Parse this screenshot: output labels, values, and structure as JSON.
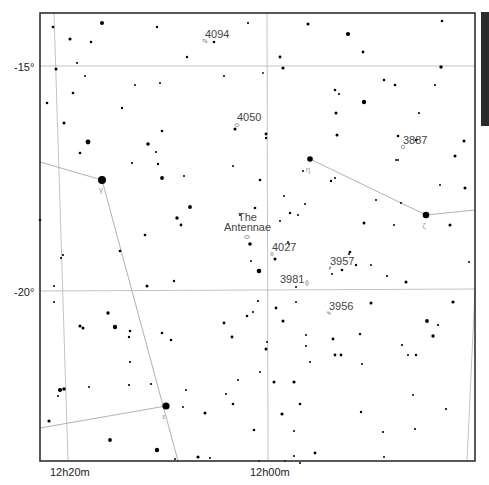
{
  "chart": {
    "frame": {
      "x": 40,
      "y": 13,
      "w": 435,
      "h": 448
    },
    "scalebar": {
      "x": 481,
      "y": 12,
      "w": 8,
      "h": 114,
      "color": "#2b2b2b"
    },
    "dec_lines": [
      {
        "label": "-15°",
        "y1": 66,
        "y2": 66,
        "label_x": 14,
        "label_y": 71
      },
      {
        "label": "-20°",
        "y1": 291,
        "y2": 289,
        "label_x": 14,
        "label_y": 296
      }
    ],
    "ra_lines": [
      {
        "label": "12h20m",
        "x1": 54,
        "y1": 13,
        "x2": 68,
        "y2": 461,
        "label_x": 50,
        "label_y": 476
      },
      {
        "label": "12h00m",
        "x1": 267,
        "y1": 13,
        "x2": 268,
        "y2": 461,
        "label_x": 250,
        "label_y": 476
      },
      {
        "label": "",
        "x1": 475,
        "y1": 290,
        "x2": 467,
        "y2": 461,
        "label_x": 0,
        "label_y": 0
      }
    ],
    "constellation_lines": [
      {
        "x1": 40,
        "y1": 162,
        "x2": 102,
        "y2": 180
      },
      {
        "x1": 102,
        "y1": 180,
        "x2": 178,
        "y2": 461
      },
      {
        "x1": 40,
        "y1": 428,
        "x2": 166,
        "y2": 406
      },
      {
        "x1": 310,
        "y1": 159,
        "x2": 426,
        "y2": 215
      },
      {
        "x1": 426,
        "y1": 215,
        "x2": 475,
        "y2": 210
      }
    ],
    "greek_labels": [
      {
        "text": "γ",
        "x": 101,
        "y": 192
      },
      {
        "text": "η",
        "x": 308,
        "y": 172
      },
      {
        "text": "ζ",
        "x": 424,
        "y": 228
      },
      {
        "text": "ε",
        "x": 164,
        "y": 419
      }
    ],
    "objects": [
      {
        "name": "4094",
        "label_x": 205,
        "label_y": 38,
        "gx": 205,
        "gy": 41,
        "rx": 2.5,
        "ry": 1,
        "rot": 30
      },
      {
        "name": "4050",
        "label_x": 237,
        "label_y": 121,
        "gx": 237,
        "gy": 125,
        "rx": 2,
        "ry": 1.5,
        "rot": 0
      },
      {
        "name": "3887",
        "label_x": 403,
        "label_y": 144,
        "gx": 403,
        "gy": 147,
        "rx": 1.7,
        "ry": 1.7,
        "rot": 0
      },
      {
        "name": "The",
        "label_x": 238,
        "label_y": 221,
        "gx": 0,
        "gy": 0,
        "rx": 0,
        "ry": 0,
        "rot": 0
      },
      {
        "name": "Antennae",
        "label_x": 224,
        "label_y": 231,
        "gx": 247,
        "gy": 237,
        "rx": 2.5,
        "ry": 1.5,
        "rot": 0
      },
      {
        "name": "4027",
        "label_x": 272,
        "label_y": 251,
        "gx": 272,
        "gy": 254,
        "rx": 1.2,
        "ry": 2,
        "rot": 0
      },
      {
        "name": "3957",
        "label_x": 330,
        "label_y": 265,
        "gx": 330,
        "gy": 268,
        "rx": 0.6,
        "ry": 1.5,
        "rot": 20
      },
      {
        "name": "3981",
        "label_x": 280,
        "label_y": 283,
        "gx": 307,
        "gy": 283,
        "rx": 1.2,
        "ry": 2.5,
        "rot": 0
      },
      {
        "name": "3956",
        "label_x": 329,
        "label_y": 310,
        "gx": 329,
        "gy": 313,
        "rx": 2,
        "ry": 0.6,
        "rot": 30
      }
    ],
    "stars": [
      [
        53,
        27,
        1.3
      ],
      [
        102,
        23,
        2.0
      ],
      [
        157,
        27,
        1.2
      ],
      [
        70,
        39,
        1.6
      ],
      [
        91,
        42,
        1.3
      ],
      [
        214,
        42,
        1.3
      ],
      [
        187,
        57,
        1.2
      ],
      [
        77,
        63,
        1.1
      ],
      [
        56,
        69,
        1.5
      ],
      [
        85,
        76,
        1.0
      ],
      [
        135,
        85,
        1.0
      ],
      [
        160,
        83,
        1.0
      ],
      [
        224,
        76,
        1.0
      ],
      [
        248,
        23,
        1.1
      ],
      [
        308,
        24,
        1.5
      ],
      [
        348,
        34,
        2.1
      ],
      [
        442,
        21,
        1.3
      ],
      [
        280,
        57,
        1.4
      ],
      [
        363,
        52,
        1.4
      ],
      [
        283,
        68,
        1.6
      ],
      [
        441,
        67,
        1.7
      ],
      [
        263,
        73,
        0.9
      ],
      [
        73,
        93,
        1.3
      ],
      [
        47,
        103,
        1.3
      ],
      [
        122,
        108,
        1.2
      ],
      [
        64,
        123,
        1.5
      ],
      [
        162,
        131,
        1.3
      ],
      [
        88,
        142,
        2.4
      ],
      [
        148,
        144,
        1.8
      ],
      [
        156,
        152,
        1.1
      ],
      [
        235,
        129,
        1.5
      ],
      [
        266,
        134,
        1.4
      ],
      [
        266,
        138,
        1.2
      ],
      [
        335,
        90,
        1.3
      ],
      [
        339,
        94,
        1.1
      ],
      [
        364,
        102,
        2.2
      ],
      [
        336,
        113,
        1.5
      ],
      [
        337,
        135,
        1.5
      ],
      [
        384,
        80,
        1.3
      ],
      [
        395,
        85,
        1.3
      ],
      [
        435,
        85,
        1.1
      ],
      [
        419,
        113,
        1.1
      ],
      [
        398,
        136,
        1.3
      ],
      [
        416,
        140,
        1.3
      ],
      [
        464,
        141,
        1.5
      ],
      [
        455,
        156,
        1.5
      ],
      [
        80,
        153,
        1.3
      ],
      [
        132,
        163,
        1.1
      ],
      [
        158,
        164,
        1.2
      ],
      [
        162,
        178,
        1.9
      ],
      [
        184,
        176,
        1.0
      ],
      [
        233,
        166,
        1.0
      ],
      [
        190,
        207,
        1.9
      ],
      [
        177,
        218,
        1.7
      ],
      [
        181,
        225,
        1.4
      ],
      [
        145,
        235,
        1.3
      ],
      [
        40,
        220,
        1.3
      ],
      [
        120,
        251,
        1.3
      ],
      [
        63,
        255,
        1.1
      ],
      [
        61,
        258,
        1.1
      ],
      [
        162,
        333,
        1.3
      ],
      [
        174,
        281,
        1.2
      ],
      [
        147,
        286,
        1.5
      ],
      [
        54,
        286,
        1.0
      ],
      [
        54,
        302,
        1.0
      ],
      [
        260,
        180,
        1.3
      ],
      [
        303,
        171,
        1.0
      ],
      [
        331,
        181,
        1.2
      ],
      [
        335,
        178,
        1.0
      ],
      [
        284,
        196,
        1.0
      ],
      [
        290,
        213,
        1.2
      ],
      [
        298,
        215,
        1.0
      ],
      [
        240,
        215,
        1.0
      ],
      [
        280,
        221,
        1.0
      ],
      [
        250,
        244,
        1.8
      ],
      [
        288,
        242,
        1.0
      ],
      [
        289,
        244,
        0.9
      ],
      [
        255,
        208,
        1.3
      ],
      [
        305,
        204,
        1.0
      ],
      [
        398,
        160,
        1.0
      ],
      [
        396,
        160,
        1.0
      ],
      [
        376,
        200,
        1.0
      ],
      [
        364,
        223,
        1.5
      ],
      [
        401,
        203,
        1.0
      ],
      [
        465,
        188,
        1.5
      ],
      [
        440,
        185,
        1.0
      ],
      [
        450,
        225,
        1.5
      ],
      [
        394,
        225,
        1.0
      ],
      [
        350,
        252,
        1.3
      ],
      [
        349,
        254,
        1.0
      ],
      [
        356,
        265,
        1.2
      ],
      [
        371,
        265,
        1.0
      ],
      [
        469,
        262,
        1.0
      ],
      [
        406,
        282,
        1.5
      ],
      [
        371,
        303,
        1.5
      ],
      [
        251,
        261,
        1.0
      ],
      [
        259,
        271,
        2.3
      ],
      [
        258,
        301,
        1.1
      ],
      [
        275,
        259,
        1.5
      ],
      [
        342,
        270,
        1.3
      ],
      [
        387,
        276,
        1.1
      ],
      [
        296,
        287,
        1.0
      ],
      [
        276,
        308,
        1.4
      ],
      [
        332,
        274,
        1.0
      ],
      [
        260,
        372,
        1.0
      ],
      [
        296,
        302,
        1.0
      ],
      [
        453,
        302,
        1.6
      ],
      [
        283,
        321,
        1.5
      ],
      [
        427,
        321,
        1.9
      ],
      [
        438,
        325,
        1.1
      ],
      [
        433,
        336,
        1.7
      ],
      [
        402,
        345,
        1.1
      ],
      [
        416,
        355,
        1.2
      ],
      [
        408,
        355,
        1.0
      ],
      [
        413,
        395,
        1.0
      ],
      [
        446,
        409,
        1.1
      ],
      [
        415,
        429,
        1.1
      ],
      [
        383,
        432,
        1.1
      ],
      [
        384,
        457,
        1.0
      ],
      [
        108,
        313,
        1.7
      ],
      [
        80,
        326,
        1.6
      ],
      [
        83,
        328,
        1.5
      ],
      [
        115,
        327,
        2.2
      ],
      [
        130,
        331,
        1.3
      ],
      [
        129,
        337,
        1.2
      ],
      [
        130,
        362,
        1.1
      ],
      [
        171,
        340,
        1.3
      ],
      [
        224,
        323,
        1.4
      ],
      [
        232,
        337,
        1.4
      ],
      [
        129,
        385,
        1.1
      ],
      [
        151,
        384,
        1.1
      ],
      [
        60,
        390,
        2.1
      ],
      [
        64,
        389,
        1.8
      ],
      [
        58,
        396,
        1.0
      ],
      [
        89,
        387,
        1.0
      ],
      [
        186,
        390,
        1.0
      ],
      [
        226,
        394,
        1.0
      ],
      [
        238,
        380,
        1.0
      ],
      [
        49,
        421,
        1.6
      ],
      [
        110,
        440,
        1.9
      ],
      [
        157,
        450,
        2.2
      ],
      [
        175,
        459,
        1.0
      ],
      [
        198,
        457,
        1.6
      ],
      [
        210,
        458,
        1.0
      ],
      [
        166,
        406,
        3.6
      ],
      [
        183,
        407,
        1.0
      ],
      [
        205,
        413,
        1.5
      ],
      [
        102,
        180,
        4.0
      ],
      [
        310,
        159,
        2.8
      ],
      [
        426,
        215,
        3.3
      ],
      [
        247,
        316,
        1.3
      ],
      [
        253,
        312,
        1.0
      ],
      [
        267,
        342,
        1.0
      ],
      [
        266,
        349,
        1.5
      ],
      [
        306,
        335,
        1.0
      ],
      [
        306,
        346,
        1.0
      ],
      [
        310,
        362,
        1.0
      ],
      [
        294,
        431,
        1.0
      ],
      [
        274,
        382,
        1.5
      ],
      [
        294,
        382,
        1.6
      ],
      [
        282,
        414,
        1.6
      ],
      [
        300,
        404,
        1.3
      ],
      [
        362,
        364,
        1.0
      ],
      [
        335,
        355,
        1.4
      ],
      [
        341,
        355,
        1.4
      ],
      [
        333,
        339,
        1.4
      ],
      [
        315,
        453,
        1.4
      ],
      [
        300,
        463,
        1.0
      ],
      [
        294,
        456,
        1.0
      ],
      [
        361,
        412,
        1.2
      ],
      [
        233,
        404,
        1.3
      ],
      [
        254,
        430,
        1.3
      ],
      [
        360,
        334,
        1.2
      ],
      [
        259,
        461,
        1.0
      ],
      [
        285,
        461,
        1.0
      ]
    ]
  }
}
